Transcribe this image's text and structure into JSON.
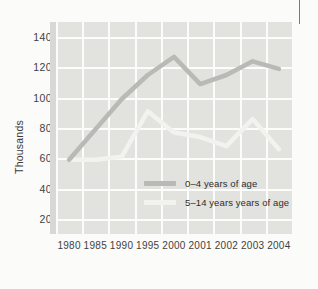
{
  "chart_data": {
    "type": "line",
    "title": "",
    "subtitle": "",
    "xlabel": "",
    "ylabel": "Thousands",
    "categories": [
      "1980",
      "1985",
      "1990",
      "1995",
      "2000",
      "2001",
      "2002",
      "2003",
      "2004"
    ],
    "x_tick_labels": [
      "1980",
      "1985",
      "1990",
      "1995",
      "2000",
      "2001",
      "2002",
      "2003",
      "2004"
    ],
    "y_tick_labels": [
      "140",
      "120",
      "100",
      "80",
      "60",
      "40",
      "20"
    ],
    "y_tick_values": [
      140,
      120,
      100,
      80,
      60,
      40,
      20
    ],
    "ylim": [
      10,
      150
    ],
    "grid": true,
    "legend_position": "inside-center-right",
    "series": [
      {
        "name": "0–4 years of age",
        "color": "#b9b9b5",
        "values": [
          59,
          79,
          99,
          115,
          127,
          109,
          115,
          124,
          119
        ]
      },
      {
        "name": "5–14 years years of age",
        "color": "#f2f2ef",
        "values": [
          59,
          59,
          61,
          91,
          77,
          74,
          68,
          86,
          66
        ]
      }
    ]
  },
  "legend": {
    "items": [
      {
        "label": "0–4 years of age",
        "color": "#b9b9b5"
      },
      {
        "label": "5–14 years years of age",
        "color": "#f2f2ef"
      }
    ]
  },
  "colors": {
    "plot_background": "#e2e2de",
    "gridline": "#fcfcfb",
    "page_background": "#fbfbfa",
    "series_dark": "#b9b9b5",
    "series_light": "#f2f2ef",
    "tick_text": "#3f3f3f"
  }
}
